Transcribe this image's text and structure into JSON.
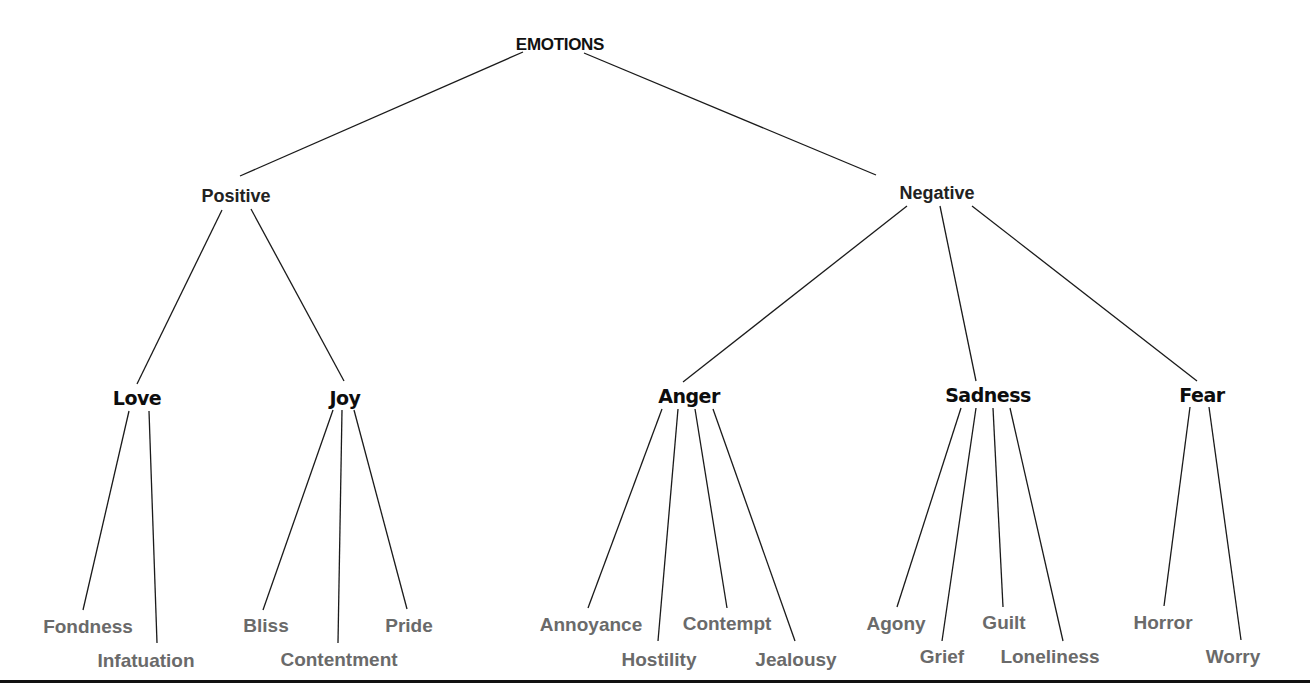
{
  "diagram": {
    "type": "tree",
    "title": "EMOTIONS",
    "root": {
      "id": "emotions",
      "label": "EMOTIONS",
      "x": 560,
      "y": 44
    },
    "nodes": [
      {
        "id": "positive",
        "label": "Positive",
        "level": 1,
        "parent": "emotions",
        "x": 236,
        "y": 196
      },
      {
        "id": "negative",
        "label": "Negative",
        "level": 1,
        "parent": "emotions",
        "x": 937,
        "y": 193
      },
      {
        "id": "love",
        "label": "Love",
        "level": 2,
        "parent": "positive",
        "x": 137,
        "y": 398
      },
      {
        "id": "joy",
        "label": "Joy",
        "level": 2,
        "parent": "positive",
        "x": 345,
        "y": 398
      },
      {
        "id": "anger",
        "label": "Anger",
        "level": 2,
        "parent": "negative",
        "x": 689,
        "y": 396
      },
      {
        "id": "sadness",
        "label": "Sadness",
        "level": 2,
        "parent": "negative",
        "x": 988,
        "y": 395
      },
      {
        "id": "fear",
        "label": "Fear",
        "level": 2,
        "parent": "negative",
        "x": 1202,
        "y": 395
      },
      {
        "id": "fondness",
        "label": "Fondness",
        "level": 3,
        "parent": "love",
        "x": 88,
        "y": 626
      },
      {
        "id": "infatuation",
        "label": "Infatuation",
        "level": 3,
        "parent": "love",
        "x": 146,
        "y": 660
      },
      {
        "id": "bliss",
        "label": "Bliss",
        "level": 3,
        "parent": "joy",
        "x": 266,
        "y": 625
      },
      {
        "id": "contentment",
        "label": "Contentment",
        "level": 3,
        "parent": "joy",
        "x": 339,
        "y": 659
      },
      {
        "id": "pride",
        "label": "Pride",
        "level": 3,
        "parent": "joy",
        "x": 409,
        "y": 625
      },
      {
        "id": "annoyance",
        "label": "Annoyance",
        "level": 3,
        "parent": "anger",
        "x": 591,
        "y": 624
      },
      {
        "id": "hostility",
        "label": "Hostility",
        "level": 3,
        "parent": "anger",
        "x": 659,
        "y": 659
      },
      {
        "id": "contempt",
        "label": "Contempt",
        "level": 3,
        "parent": "anger",
        "x": 727,
        "y": 623
      },
      {
        "id": "jealousy",
        "label": "Jealousy",
        "level": 3,
        "parent": "anger",
        "x": 796,
        "y": 659
      },
      {
        "id": "agony",
        "label": "Agony",
        "level": 3,
        "parent": "sadness",
        "x": 896,
        "y": 623
      },
      {
        "id": "grief",
        "label": "Grief",
        "level": 3,
        "parent": "sadness",
        "x": 942,
        "y": 656
      },
      {
        "id": "guilt",
        "label": "Guilt",
        "level": 3,
        "parent": "sadness",
        "x": 1004,
        "y": 622
      },
      {
        "id": "loneliness",
        "label": "Loneliness",
        "level": 3,
        "parent": "sadness",
        "x": 1050,
        "y": 656
      },
      {
        "id": "horror",
        "label": "Horror",
        "level": 3,
        "parent": "fear",
        "x": 1163,
        "y": 622
      },
      {
        "id": "worry",
        "label": "Worry",
        "level": 3,
        "parent": "fear",
        "x": 1233,
        "y": 656
      }
    ],
    "edges": [
      {
        "from": "emotions",
        "to": "positive",
        "x1": 523,
        "y1": 52,
        "x2": 240,
        "y2": 176
      },
      {
        "from": "emotions",
        "to": "negative",
        "x1": 584,
        "y1": 53,
        "x2": 876,
        "y2": 175
      },
      {
        "from": "positive",
        "to": "love",
        "x1": 222,
        "y1": 210,
        "x2": 137,
        "y2": 384
      },
      {
        "from": "positive",
        "to": "joy",
        "x1": 251,
        "y1": 209,
        "x2": 344,
        "y2": 381
      },
      {
        "from": "negative",
        "to": "anger",
        "x1": 907,
        "y1": 206,
        "x2": 683,
        "y2": 382
      },
      {
        "from": "negative",
        "to": "sadness",
        "x1": 940,
        "y1": 206,
        "x2": 976,
        "y2": 381
      },
      {
        "from": "negative",
        "to": "fear",
        "x1": 972,
        "y1": 206,
        "x2": 1197,
        "y2": 381
      },
      {
        "from": "love",
        "to": "fondness",
        "x1": 129,
        "y1": 411,
        "x2": 83,
        "y2": 610
      },
      {
        "from": "love",
        "to": "infatuation",
        "x1": 149,
        "y1": 411,
        "x2": 157,
        "y2": 643
      },
      {
        "from": "joy",
        "to": "bliss",
        "x1": 333,
        "y1": 410,
        "x2": 263,
        "y2": 610
      },
      {
        "from": "joy",
        "to": "contentment",
        "x1": 342,
        "y1": 410,
        "x2": 338,
        "y2": 643
      },
      {
        "from": "joy",
        "to": "pride",
        "x1": 354,
        "y1": 410,
        "x2": 407,
        "y2": 609
      },
      {
        "from": "anger",
        "to": "annoyance",
        "x1": 662,
        "y1": 409,
        "x2": 588,
        "y2": 608
      },
      {
        "from": "anger",
        "to": "hostility",
        "x1": 678,
        "y1": 409,
        "x2": 658,
        "y2": 641
      },
      {
        "from": "anger",
        "to": "contempt",
        "x1": 695,
        "y1": 409,
        "x2": 727,
        "y2": 608
      },
      {
        "from": "anger",
        "to": "jealousy",
        "x1": 713,
        "y1": 409,
        "x2": 795,
        "y2": 641
      },
      {
        "from": "sadness",
        "to": "agony",
        "x1": 961,
        "y1": 408,
        "x2": 897,
        "y2": 607
      },
      {
        "from": "sadness",
        "to": "grief",
        "x1": 976,
        "y1": 408,
        "x2": 942,
        "y2": 641
      },
      {
        "from": "sadness",
        "to": "guilt",
        "x1": 993,
        "y1": 408,
        "x2": 1003,
        "y2": 607
      },
      {
        "from": "sadness",
        "to": "loneliness",
        "x1": 1010,
        "y1": 408,
        "x2": 1063,
        "y2": 641
      },
      {
        "from": "fear",
        "to": "horror",
        "x1": 1190,
        "y1": 407,
        "x2": 1164,
        "y2": 606
      },
      {
        "from": "fear",
        "to": "worry",
        "x1": 1209,
        "y1": 407,
        "x2": 1241,
        "y2": 640
      }
    ],
    "style": {
      "line_color": "#1a1a1a",
      "root_color": "#111111",
      "level1_color": "#222222",
      "level2_color": "#0d0d0d",
      "leaf_color": "#6a6a6a",
      "background": "#ffffff"
    }
  }
}
